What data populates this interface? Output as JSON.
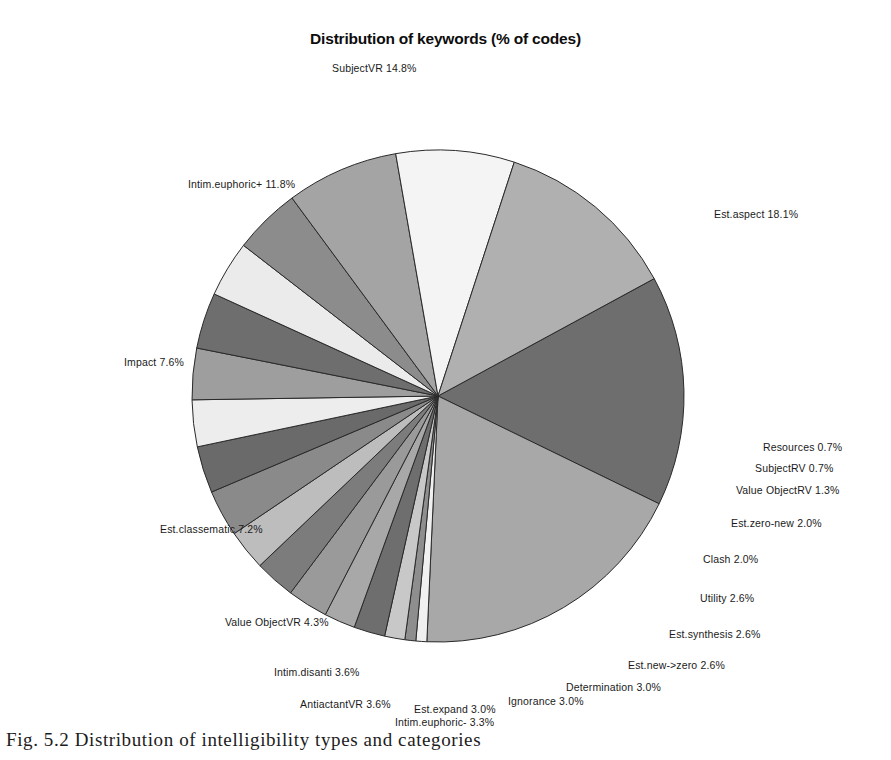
{
  "figure": {
    "caption": "Fig. 5.2 Distribution of intelligibility types and categories"
  },
  "chart_data": {
    "type": "pie",
    "title": "Distribution of keywords (% of codes)",
    "unit": "%",
    "legend": "none",
    "start_angle_deg": -28.5,
    "direction": "clockwise",
    "center": {
      "x": 438,
      "y": 396
    },
    "radius": 246,
    "categories": [
      "SubjectVR",
      "Est.aspect",
      "Resources",
      "SubjectRV",
      "Value ObjectRV",
      "Est.zero-new",
      "Clash",
      "Utility",
      "Est.synthesis",
      "Est.new->zero",
      "Determination",
      "Ignorance",
      "Est.expand",
      "Intim.euphoric-",
      "AntiactantVR",
      "Intim.disanti",
      "Value ObjectVR",
      "Est.classematic",
      "Impact",
      "Intim.euphoric+"
    ],
    "values": [
      14.8,
      18.1,
      0.7,
      0.7,
      1.3,
      2.0,
      2.0,
      2.6,
      2.6,
      2.6,
      3.0,
      3.0,
      3.0,
      3.3,
      3.6,
      3.6,
      4.3,
      7.2,
      7.6,
      11.8
    ],
    "colors": [
      "#6e6e6e",
      "#a8a8a8",
      "#f0f0f0",
      "#8e8e8e",
      "#c8c8c8",
      "#6e6e6e",
      "#a8a8a8",
      "#9a9a9a",
      "#7c7c7c",
      "#bdbdbd",
      "#8a8a8a",
      "#6a6a6a",
      "#ededed",
      "#9e9e9e",
      "#6e6e6e",
      "#ebebeb",
      "#8c8c8c",
      "#a4a4a4",
      "#f4f4f4",
      "#b0b0b0"
    ],
    "slices": [
      {
        "label": "SubjectVR",
        "value": 14.8,
        "text": "SubjectVR  14.8%",
        "color": "#6e6e6e",
        "lx": 332,
        "ly": 62,
        "side": "left"
      },
      {
        "label": "Est.aspect",
        "value": 18.1,
        "text": "Est.aspect  18.1%",
        "color": "#a8a8a8",
        "lx": 714,
        "ly": 208,
        "side": "right"
      },
      {
        "label": "Resources",
        "value": 0.7,
        "text": "Resources  0.7%",
        "color": "#f0f0f0",
        "lx": 763,
        "ly": 441,
        "side": "right"
      },
      {
        "label": "SubjectRV",
        "value": 0.7,
        "text": "SubjectRV  0.7%",
        "color": "#8e8e8e",
        "lx": 755,
        "ly": 462,
        "side": "right"
      },
      {
        "label": "Value ObjectRV",
        "value": 1.3,
        "text": "Value ObjectRV  1.3%",
        "color": "#c8c8c8",
        "lx": 736,
        "ly": 484,
        "side": "right"
      },
      {
        "label": "Est.zero-new",
        "value": 2.0,
        "text": "Est.zero-new  2.0%",
        "color": "#6e6e6e",
        "lx": 731,
        "ly": 517,
        "side": "right"
      },
      {
        "label": "Clash",
        "value": 2.0,
        "text": "Clash  2.0%",
        "color": "#a8a8a8",
        "lx": 703,
        "ly": 553,
        "side": "right"
      },
      {
        "label": "Utility",
        "value": 2.6,
        "text": "Utility  2.6%",
        "color": "#9a9a9a",
        "lx": 700,
        "ly": 592,
        "side": "right"
      },
      {
        "label": "Est.synthesis",
        "value": 2.6,
        "text": "Est.synthesis  2.6%",
        "color": "#7c7c7c",
        "lx": 669,
        "ly": 628,
        "side": "right"
      },
      {
        "label": "Est.new->zero",
        "value": 2.6,
        "text": "Est.new->zero  2.6%",
        "color": "#bdbdbd",
        "lx": 628,
        "ly": 659,
        "side": "right"
      },
      {
        "label": "Determination",
        "value": 3.0,
        "text": "Determination  3.0%",
        "color": "#8a8a8a",
        "lx": 566,
        "ly": 681,
        "side": "right"
      },
      {
        "label": "Ignorance",
        "value": 3.0,
        "text": "Ignorance  3.0%",
        "color": "#6a6a6a",
        "lx": 508,
        "ly": 695,
        "side": "right"
      },
      {
        "label": "Est.expand",
        "value": 3.0,
        "text": "Est.expand  3.0%",
        "color": "#ededed",
        "lx": 414,
        "ly": 703,
        "side": "right"
      },
      {
        "label": "Intim.euphoric-",
        "value": 3.3,
        "text": "Intim.euphoric-  3.3%",
        "color": "#9e9e9e",
        "lx": 395,
        "ly": 716,
        "side": "left"
      },
      {
        "label": "AntiactantVR",
        "value": 3.6,
        "text": "AntiactantVR  3.6%",
        "color": "#6e6e6e",
        "lx": 300,
        "ly": 698,
        "side": "left"
      },
      {
        "label": "Intim.disanti",
        "value": 3.6,
        "text": "Intim.disanti  3.6%",
        "color": "#ebebeb",
        "lx": 274,
        "ly": 666,
        "side": "left"
      },
      {
        "label": "Value ObjectVR",
        "value": 4.3,
        "text": "Value ObjectVR  4.3%",
        "color": "#8c8c8c",
        "lx": 225,
        "ly": 616,
        "side": "left"
      },
      {
        "label": "Est.classematic",
        "value": 7.2,
        "text": "Est.classematic  7.2%",
        "color": "#a4a4a4",
        "lx": 160,
        "ly": 523,
        "side": "left"
      },
      {
        "label": "Impact",
        "value": 7.6,
        "text": "Impact  7.6%",
        "color": "#f4f4f4",
        "lx": 124,
        "ly": 356,
        "side": "left"
      },
      {
        "label": "Intim.euphoric+",
        "value": 11.8,
        "text": "Intim.euphoric+  11.8%",
        "color": "#b0b0b0",
        "lx": 188,
        "ly": 178,
        "side": "left"
      }
    ]
  }
}
